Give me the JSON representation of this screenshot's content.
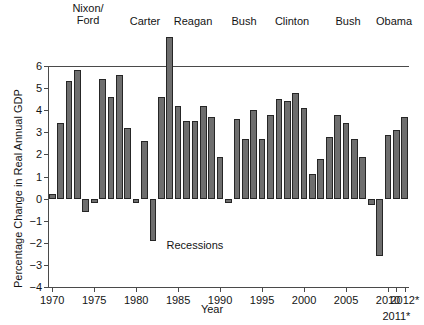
{
  "chart_data": {
    "type": "bar",
    "title": "",
    "xlabel": "Year",
    "ylabel": "Percentage Change in Real Annual GDP",
    "ylim": [
      -4,
      6
    ],
    "ytick_values": [
      6,
      5,
      4,
      3,
      2,
      1,
      0,
      -1,
      -2,
      -3,
      -4
    ],
    "ytick_labels": [
      "6",
      "5",
      "4",
      "3",
      "2",
      "1",
      "0",
      "−1",
      "−2",
      "−3",
      "−4"
    ],
    "xtick_labels": [
      "1970",
      "1975",
      "1980",
      "1985",
      "1990",
      "1995",
      "2000",
      "2005",
      "2010",
      "2011*",
      "2012*"
    ],
    "grid": false,
    "legend": "none",
    "bar_color": "#6e6e6e",
    "bar_edge_color": "#262626",
    "annotations": [
      {
        "text": "Recessions",
        "x": 1987,
        "y": -2.1
      }
    ],
    "categories": [
      "1970",
      "1971",
      "1972",
      "1973",
      "1974",
      "1975",
      "1976",
      "1977",
      "1978",
      "1979",
      "1980",
      "1981",
      "1982",
      "1983",
      "1984",
      "1985",
      "1986",
      "1987",
      "1988",
      "1989",
      "1990",
      "1991",
      "1992",
      "1993",
      "1994",
      "1995",
      "1996",
      "1997",
      "1998",
      "1999",
      "2000",
      "2001",
      "2002",
      "2003",
      "2004",
      "2005",
      "2006",
      "2007",
      "2008",
      "2009",
      "2010",
      "2011*",
      "2012*"
    ],
    "values": [
      0.2,
      3.4,
      5.3,
      5.8,
      -0.6,
      -0.2,
      5.4,
      4.6,
      5.6,
      3.2,
      -0.2,
      2.6,
      -1.9,
      4.6,
      7.3,
      4.2,
      3.5,
      3.5,
      4.2,
      3.7,
      1.9,
      -0.2,
      3.6,
      2.7,
      4.0,
      2.7,
      3.8,
      4.5,
      4.4,
      4.8,
      4.1,
      1.1,
      1.8,
      2.8,
      3.8,
      3.4,
      2.7,
      1.9,
      -0.3,
      -2.6,
      2.9,
      3.1,
      3.7
    ]
  },
  "presidents": [
    {
      "label": "Nixon/\nFord",
      "x_center": 88,
      "multiline": true
    },
    {
      "label": "Carter",
      "x_center": 145,
      "multiline": false
    },
    {
      "label": "Reagan",
      "x_center": 193,
      "multiline": false
    },
    {
      "label": "Bush",
      "x_center": 244,
      "multiline": false
    },
    {
      "label": "Clinton",
      "x_center": 292,
      "multiline": false
    },
    {
      "label": "Bush",
      "x_center": 348,
      "multiline": false
    },
    {
      "label": "Obama",
      "x_center": 394,
      "multiline": false
    }
  ]
}
